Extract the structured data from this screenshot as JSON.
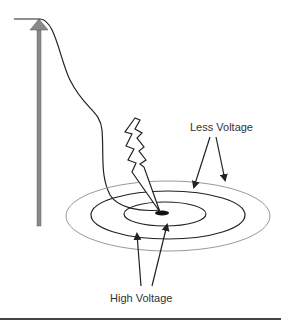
{
  "diagram": {
    "labels": {
      "less_voltage": "Less Voltage",
      "high_voltage": "High Voltage"
    },
    "colors": {
      "line": "#222222",
      "outer_ring": "#999999",
      "pole": "#8a8a8a",
      "text": "#333333",
      "bottom_rule": "#444444"
    }
  }
}
